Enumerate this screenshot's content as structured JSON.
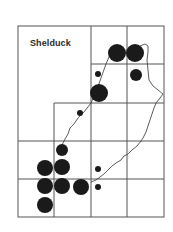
{
  "map": {
    "title": "Shelduck",
    "ink_color": "#1a1a1a",
    "grid_color": "#555555",
    "background": "#ffffff",
    "frame": {
      "x1": 18,
      "y1": 26,
      "x2": 164,
      "y2": 217
    },
    "grid_lines": {
      "vertical": [
        {
          "x": 91,
          "y1": 26,
          "y2": 217
        },
        {
          "x": 127,
          "y1": 26,
          "y2": 217
        },
        {
          "x": 54,
          "y1": 103,
          "y2": 217
        }
      ],
      "horizontal": [
        {
          "y": 64,
          "x1": 91,
          "x2": 164
        },
        {
          "y": 103,
          "x1": 54,
          "x2": 164
        },
        {
          "y": 141,
          "x1": 18,
          "x2": 164
        },
        {
          "y": 179,
          "x1": 18,
          "x2": 164
        }
      ]
    },
    "records": [
      {
        "cx": 117,
        "cy": 53,
        "r": 9,
        "size": "large"
      },
      {
        "cx": 135,
        "cy": 53,
        "r": 9,
        "size": "large"
      },
      {
        "cx": 98,
        "cy": 74,
        "r": 3,
        "size": "small"
      },
      {
        "cx": 136,
        "cy": 75,
        "r": 6,
        "size": "medium"
      },
      {
        "cx": 99,
        "cy": 93,
        "r": 9,
        "size": "large"
      },
      {
        "cx": 80,
        "cy": 113,
        "r": 3,
        "size": "small"
      },
      {
        "cx": 62,
        "cy": 150,
        "r": 6,
        "size": "medium"
      },
      {
        "cx": 45,
        "cy": 168,
        "r": 8,
        "size": "large"
      },
      {
        "cx": 62,
        "cy": 167,
        "r": 8,
        "size": "large"
      },
      {
        "cx": 45,
        "cy": 186,
        "r": 8,
        "size": "large"
      },
      {
        "cx": 62,
        "cy": 186,
        "r": 8,
        "size": "large"
      },
      {
        "cx": 81,
        "cy": 187,
        "r": 8,
        "size": "large"
      },
      {
        "cx": 45,
        "cy": 205,
        "r": 8,
        "size": "large"
      },
      {
        "cx": 98,
        "cy": 169,
        "r": 3,
        "size": "small"
      },
      {
        "cx": 98,
        "cy": 187,
        "r": 3,
        "size": "small"
      }
    ],
    "coastlines": [
      "M 112 50 L 106 64 L 101 78 L 96 92 L 91 103 L 84 112 L 78 118 L 74 124 L 70 128 L 68 134 L 65 139 L 63 143 L 61 147",
      "M 140 46 L 145 44 L 148 46 L 148 52 L 147 60 L 148 70 L 149 80 L 153 86 L 158 90 L 163 94 L 160 98 L 156 103 L 154 108 L 152 114 L 150 120 L 148 126 L 146 132 L 143 138 L 141 141 L 137 146 L 132 150 L 128 154 L 124 156 L 121 160 L 116 163 L 112 166 L 108 170 L 104 174 L 100 177 L 96 180 L 91 182"
    ]
  }
}
